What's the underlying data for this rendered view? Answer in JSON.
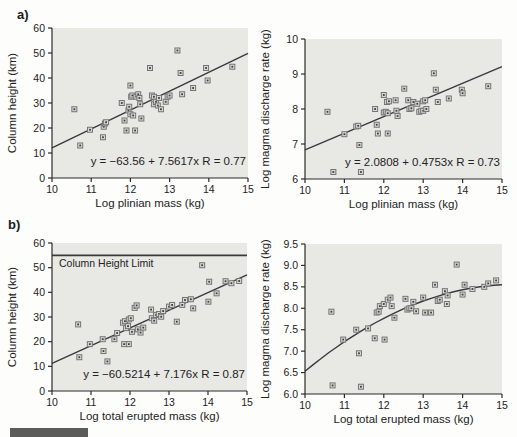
{
  "figure_labels": {
    "a": "a)",
    "b": "b)"
  },
  "colors": {
    "page_bg": "#fdfdfc",
    "plot_bg": "#e8e8e5",
    "axis": "#2b2b2b",
    "line": "#3a3a3a",
    "marker_stroke": "#757573",
    "marker_fill": "#d8d8d5",
    "marker_dot": "#3e3e3c",
    "text": "#232323",
    "bar": "#5c5c5a"
  },
  "chart_data": [
    {
      "id": "column-height-vs-plinian-mass",
      "type": "scatter",
      "title": "",
      "xlabel": "Log plinian mass (kg)",
      "ylabel": "Column height (km)",
      "xlim": [
        10,
        15
      ],
      "ylim": [
        0,
        60
      ],
      "xticks": [
        "10",
        "11",
        "12",
        "13",
        "14",
        "15"
      ],
      "yticks": [
        "0",
        "10",
        "20",
        "30",
        "40",
        "50",
        "60"
      ],
      "grid": false,
      "equation": "y = −63.56 + 7.5617x   R = 0.77",
      "fit": {
        "type": "linear",
        "intercept": -63.56,
        "slope": 7.5617
      },
      "frame": {
        "l": 52,
        "t": 28,
        "r": 248,
        "b": 178
      },
      "points": [
        [
          10.57,
          27.5
        ],
        [
          10.72,
          13
        ],
        [
          10.97,
          19.3
        ],
        [
          11.3,
          16.3
        ],
        [
          11.32,
          20.5
        ],
        [
          11.35,
          21.8
        ],
        [
          11.38,
          22.3
        ],
        [
          11.78,
          30
        ],
        [
          11.85,
          23
        ],
        [
          11.9,
          19
        ],
        [
          11.95,
          27
        ],
        [
          11.97,
          28.5
        ],
        [
          12.0,
          25.5
        ],
        [
          12.0,
          37
        ],
        [
          12.02,
          32.5
        ],
        [
          12.05,
          33
        ],
        [
          12.07,
          25
        ],
        [
          12.12,
          19
        ],
        [
          12.15,
          32.5
        ],
        [
          12.2,
          33.5
        ],
        [
          12.23,
          32
        ],
        [
          12.25,
          29.5
        ],
        [
          12.28,
          23.8
        ],
        [
          12.5,
          44
        ],
        [
          12.55,
          33
        ],
        [
          12.6,
          32.5
        ],
        [
          12.6,
          29.5
        ],
        [
          12.65,
          30.5
        ],
        [
          12.7,
          29
        ],
        [
          12.73,
          32
        ],
        [
          12.78,
          27.5
        ],
        [
          12.9,
          30.5
        ],
        [
          12.95,
          32.5
        ],
        [
          13.0,
          33
        ],
        [
          13.2,
          51
        ],
        [
          13.28,
          42
        ],
        [
          13.32,
          33.5
        ],
        [
          13.6,
          36
        ],
        [
          13.93,
          44
        ],
        [
          13.97,
          39
        ],
        [
          14.6,
          44.5
        ]
      ]
    },
    {
      "id": "discharge-rate-vs-plinian-mass",
      "type": "scatter",
      "title": "",
      "xlabel": "Log plinian mass (kg)",
      "ylabel": "Log magma discharge rate (kg)",
      "xlim": [
        10,
        15
      ],
      "ylim": [
        6,
        10
      ],
      "xticks": [
        "10",
        "11",
        "12",
        "13",
        "14",
        "15"
      ],
      "yticks": [
        "6",
        "7",
        "8",
        "9",
        "10"
      ],
      "grid": false,
      "equation": "y = 2.0808 + 0.4753x   R = 0.73",
      "fit": {
        "type": "linear",
        "intercept": 2.0808,
        "slope": 0.4753
      },
      "frame": {
        "l": 46,
        "t": 39,
        "r": 243,
        "b": 179
      },
      "points": [
        [
          10.57,
          7.92
        ],
        [
          10.72,
          6.2
        ],
        [
          11.0,
          7.28
        ],
        [
          11.3,
          7.5
        ],
        [
          11.35,
          7.52
        ],
        [
          11.38,
          6.97
        ],
        [
          11.42,
          6.2
        ],
        [
          11.78,
          8.0
        ],
        [
          11.82,
          7.55
        ],
        [
          11.85,
          7.3
        ],
        [
          12.0,
          8.4
        ],
        [
          12.0,
          7.9
        ],
        [
          12.05,
          7.92
        ],
        [
          12.1,
          7.88
        ],
        [
          12.08,
          8.2
        ],
        [
          12.13,
          8.22
        ],
        [
          12.1,
          7.3
        ],
        [
          12.3,
          8.25
        ],
        [
          12.32,
          7.95
        ],
        [
          12.35,
          7.8
        ],
        [
          12.52,
          8.58
        ],
        [
          12.62,
          8.25
        ],
        [
          12.65,
          8.0
        ],
        [
          12.7,
          8.02
        ],
        [
          12.75,
          8.2
        ],
        [
          12.85,
          8.15
        ],
        [
          12.9,
          7.92
        ],
        [
          12.95,
          7.95
        ],
        [
          13.0,
          7.95
        ],
        [
          13.0,
          8.22
        ],
        [
          13.05,
          8.25
        ],
        [
          13.08,
          8.0
        ],
        [
          13.27,
          9.02
        ],
        [
          13.32,
          8.55
        ],
        [
          13.37,
          8.2
        ],
        [
          13.65,
          8.3
        ],
        [
          13.98,
          8.55
        ],
        [
          14.0,
          8.45
        ],
        [
          14.65,
          8.65
        ]
      ]
    },
    {
      "id": "column-height-vs-total-erupted-mass",
      "type": "scatter",
      "title": "",
      "xlabel": "Log total erupted mass (kg)",
      "ylabel": "Column height (km)",
      "xlim": [
        10,
        15
      ],
      "ylim": [
        0,
        60
      ],
      "xticks": [
        "10",
        "11",
        "12",
        "13",
        "14",
        "15"
      ],
      "yticks": [
        "0",
        "10",
        "20",
        "30",
        "40",
        "50",
        "60"
      ],
      "grid": false,
      "equation": "y = −60.5214 + 7.176x   R = 0.87",
      "fit": {
        "type": "linear",
        "intercept": -60.5214,
        "slope": 7.176
      },
      "limit_line": {
        "y": 55,
        "label": "Column Height Limit"
      },
      "frame": {
        "l": 52,
        "t": 28,
        "r": 247,
        "b": 176
      },
      "points": [
        [
          10.67,
          27
        ],
        [
          10.7,
          13.7
        ],
        [
          10.97,
          19
        ],
        [
          11.3,
          21
        ],
        [
          11.32,
          16.2
        ],
        [
          11.42,
          12
        ],
        [
          11.6,
          21
        ],
        [
          11.67,
          23.5
        ],
        [
          11.82,
          27.7
        ],
        [
          11.87,
          28.3
        ],
        [
          11.85,
          19
        ],
        [
          11.97,
          19
        ],
        [
          11.9,
          25.5
        ],
        [
          11.95,
          26.3
        ],
        [
          11.97,
          29
        ],
        [
          12.02,
          29.5
        ],
        [
          12.05,
          24
        ],
        [
          12.12,
          33.7
        ],
        [
          12.17,
          34.7
        ],
        [
          12.2,
          25
        ],
        [
          12.27,
          23.7
        ],
        [
          12.34,
          25.7
        ],
        [
          12.54,
          33
        ],
        [
          12.56,
          29.5
        ],
        [
          12.62,
          28.5
        ],
        [
          12.67,
          30.8
        ],
        [
          12.74,
          31.2
        ],
        [
          12.8,
          30.1
        ],
        [
          12.85,
          32.4
        ],
        [
          13.0,
          34.2
        ],
        [
          13.08,
          34.9
        ],
        [
          13.2,
          28.1
        ],
        [
          13.34,
          34.9
        ],
        [
          13.41,
          36.9
        ],
        [
          13.56,
          37.2
        ],
        [
          13.62,
          33.5
        ],
        [
          13.85,
          51
        ],
        [
          14.01,
          36.2
        ],
        [
          14.03,
          44.3
        ],
        [
          14.22,
          39.6
        ],
        [
          14.45,
          44.5
        ],
        [
          14.6,
          43.7
        ],
        [
          14.8,
          44.6
        ]
      ]
    },
    {
      "id": "discharge-rate-vs-total-erupted-mass",
      "type": "scatter",
      "title": "",
      "xlabel": "Log total erupted mass (kg)",
      "ylabel": "Log magma discharge rate (kg)",
      "xlim": [
        10,
        15
      ],
      "ylim": [
        6.0,
        9.5
      ],
      "xticks": [
        "10",
        "11",
        "12",
        "13",
        "14",
        "15"
      ],
      "yticks": [
        "6.0",
        "6.5",
        "7.0",
        "7.5",
        "8.0",
        "8.5",
        "9.0",
        "9.5"
      ],
      "grid": false,
      "equation": "",
      "fit": {
        "type": "quadratic",
        "c0": -8.21,
        "c1": 2.1873,
        "c2": -0.07133
      },
      "frame": {
        "l": 46,
        "t": 29,
        "r": 243,
        "b": 179
      },
      "points": [
        [
          10.67,
          7.92
        ],
        [
          10.7,
          6.2
        ],
        [
          10.97,
          7.27
        ],
        [
          11.3,
          7.5
        ],
        [
          11.37,
          6.95
        ],
        [
          11.42,
          6.17
        ],
        [
          11.6,
          7.53
        ],
        [
          11.77,
          7.3
        ],
        [
          11.82,
          7.9
        ],
        [
          11.87,
          7.92
        ],
        [
          11.9,
          8.05
        ],
        [
          12.0,
          8.1
        ],
        [
          12.02,
          7.27
        ],
        [
          12.1,
          8.2
        ],
        [
          12.17,
          8.25
        ],
        [
          12.2,
          8.05
        ],
        [
          12.27,
          7.78
        ],
        [
          12.55,
          8.22
        ],
        [
          12.6,
          7.97
        ],
        [
          12.65,
          8.0
        ],
        [
          12.7,
          8.0
        ],
        [
          12.75,
          8.15
        ],
        [
          12.82,
          7.93
        ],
        [
          13.0,
          8.25
        ],
        [
          13.05,
          7.9
        ],
        [
          13.2,
          7.9
        ],
        [
          13.3,
          8.55
        ],
        [
          13.37,
          8.17
        ],
        [
          13.42,
          8.2
        ],
        [
          13.55,
          8.4
        ],
        [
          13.6,
          8.1
        ],
        [
          13.62,
          8.3
        ],
        [
          13.85,
          9.02
        ],
        [
          14.0,
          8.32
        ],
        [
          14.05,
          8.55
        ],
        [
          14.25,
          8.45
        ],
        [
          14.55,
          8.5
        ],
        [
          14.65,
          8.58
        ],
        [
          14.85,
          8.65
        ]
      ]
    }
  ]
}
